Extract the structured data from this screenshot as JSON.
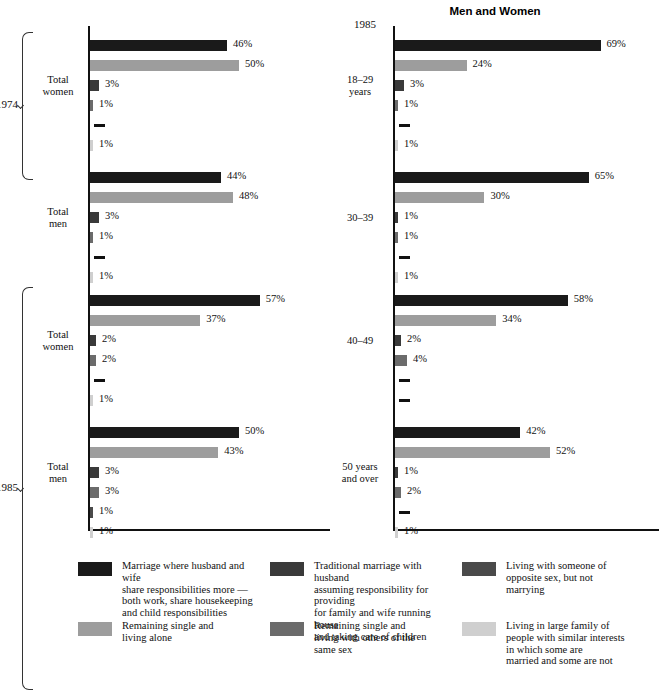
{
  "title": "Men and Women",
  "panels": {
    "left": {
      "year_groups": [
        {
          "year": "1974",
          "groups": [
            "Total\nwomen",
            "Total\nmen"
          ]
        },
        {
          "year": "1985",
          "groups": [
            "Total\nwomen",
            "Total\nmen"
          ]
        }
      ],
      "row_labels": [
        "Total\nwomen",
        "Total\nmen",
        "Total\nwomen",
        "Total\nmen"
      ],
      "year_labels": [
        "1974",
        "1985"
      ]
    },
    "right": {
      "top_year": "1985",
      "row_labels": [
        "18–29\nyears",
        "30–39",
        "40–49",
        "50 years\nand over"
      ]
    }
  },
  "series": [
    {
      "key": "shared_marriage",
      "color": "#1a1a1a",
      "label": "Marriage where husband and wife\nshare responsibilities more —\nboth work, share housekeeping\nand child responsibilities"
    },
    {
      "key": "single_alone",
      "color": "#9d9d9d",
      "label": "Remaining single and\nliving alone"
    },
    {
      "key": "traditional_marriage",
      "color": "#3a3a3a",
      "label": "Traditional marriage with husband\nassuming responsibility for providing\nfor family and wife running house\nand taking care of children"
    },
    {
      "key": "single_same_sex",
      "color": "#6b6b6b",
      "label": "Remaining single and\nliving with others of the\nsame sex"
    },
    {
      "key": "living_opposite_sex",
      "color": "#4a4a4a",
      "label": "Living with someone of\nopposite sex, but not\nmarrying"
    },
    {
      "key": "large_family",
      "color": "#cfcfcf",
      "label": "Living in large family of\npeople with similar interests\nin which some are\nmarried and some are not"
    }
  ],
  "legend_order": [
    {
      "swatch": "#1a1a1a",
      "text": "Marriage where husband and wife\nshare responsibilities more —\nboth work, share housekeeping\nand child responsibilities"
    },
    {
      "swatch": "#3a3a3a",
      "text": "Traditional marriage with husband\nassuming responsibility for providing\nfor family and wife running house\nand taking care of children"
    },
    {
      "swatch": "#4a4a4a",
      "text": "Living with someone of\nopposite sex, but not\nmarrying"
    },
    {
      "swatch": "#9d9d9d",
      "text": "Remaining single and\nliving alone"
    },
    {
      "swatch": "#6b6b6b",
      "text": "Remaining single and\nliving with others of the\nsame sex"
    },
    {
      "swatch": "#cfcfcf",
      "text": "Living in large family of\npeople with similar interests\nin which some are\nmarried and some are not"
    }
  ],
  "chart_data": {
    "type": "bar",
    "title": "Men and Women",
    "xlabel": "",
    "ylabel": "",
    "xlim": [
      0,
      70
    ],
    "grid": false,
    "orientation": "horizontal",
    "legend_position": "bottom",
    "series_names": [
      "Marriage where husband and wife share responsibilities more — both work, share housekeeping and child responsibilities",
      "Remaining single and living alone",
      "Traditional marriage with husband assuming responsibility for providing for family and wife running house and taking care of children",
      "Remaining single and living with others of the same sex",
      "Living with someone of opposite sex, but not marrying",
      "Living in large family of people with similar interests in which some are married and some are not"
    ],
    "groups": [
      {
        "panel": "left",
        "year": "1974",
        "category": "Total women",
        "values": [
          46,
          50,
          3,
          1,
          0,
          1
        ],
        "labels": [
          "46%",
          "50%",
          "3%",
          "1%",
          "",
          "1%"
        ]
      },
      {
        "panel": "left",
        "year": "1974",
        "category": "Total men",
        "values": [
          44,
          48,
          3,
          1,
          0,
          1
        ],
        "labels": [
          "44%",
          "48%",
          "3%",
          "1%",
          "",
          "1%"
        ]
      },
      {
        "panel": "left",
        "year": "1985",
        "category": "Total women",
        "values": [
          57,
          37,
          2,
          2,
          0,
          1
        ],
        "labels": [
          "57%",
          "37%",
          "2%",
          "2%",
          "",
          "1%"
        ]
      },
      {
        "panel": "left",
        "year": "1985",
        "category": "Total men",
        "values": [
          50,
          43,
          3,
          3,
          1,
          1
        ],
        "labels": [
          "50%",
          "43%",
          "3%",
          "3%",
          "1%",
          "1%"
        ]
      },
      {
        "panel": "right",
        "year": "1985",
        "category": "18-29 years",
        "values": [
          69,
          24,
          3,
          1,
          0,
          1
        ],
        "labels": [
          "69%",
          "24%",
          "3%",
          "1%",
          "",
          "1%"
        ]
      },
      {
        "panel": "right",
        "year": "1985",
        "category": "30-39",
        "values": [
          65,
          30,
          1,
          1,
          0,
          1
        ],
        "labels": [
          "65%",
          "30%",
          "1%",
          "1%",
          "",
          "1%"
        ]
      },
      {
        "panel": "right",
        "year": "1985",
        "category": "40-49",
        "values": [
          58,
          34,
          2,
          4,
          0,
          0
        ],
        "labels": [
          "58%",
          "34%",
          "2%",
          "4%",
          "",
          ""
        ]
      },
      {
        "panel": "right",
        "year": "1985",
        "category": "50 years and over",
        "values": [
          42,
          52,
          1,
          2,
          0,
          1
        ],
        "labels": [
          "42%",
          "52%",
          "1%",
          "2%",
          "",
          "1%"
        ]
      }
    ]
  }
}
